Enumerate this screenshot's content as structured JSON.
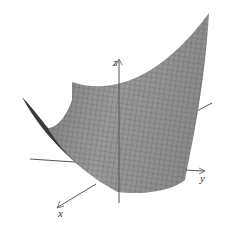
{
  "figure": {
    "surface_color": "#8f8f8f",
    "mesh_color": "#4a4a4a",
    "axis_color": "#555555",
    "axes": {
      "x_label": "x",
      "y_label": "y",
      "z_label": "z"
    }
  }
}
